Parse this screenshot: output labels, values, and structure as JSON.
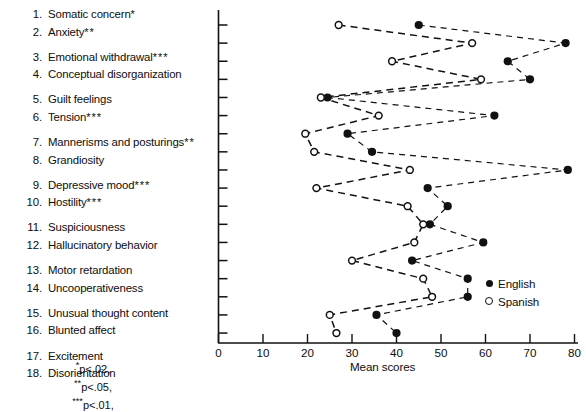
{
  "figure": {
    "items": [
      {
        "num": "1.",
        "text": "Somatic concern",
        "stars": "*"
      },
      {
        "num": "2.",
        "text": "Anxiety",
        "stars": "**"
      },
      {
        "num": "3.",
        "text": "Emotional withdrawal",
        "stars": "***"
      },
      {
        "num": "4.",
        "text": "Conceptual disorganization",
        "stars": ""
      },
      {
        "num": "5.",
        "text": "Guilt feelings",
        "stars": ""
      },
      {
        "num": "6.",
        "text": "Tension",
        "stars": "***"
      },
      {
        "num": "7.",
        "text": "Mannerisms and posturings",
        "stars": "**"
      },
      {
        "num": "8.",
        "text": "Grandiosity",
        "stars": ""
      },
      {
        "num": "9.",
        "text": "Depressive mood",
        "stars": "***"
      },
      {
        "num": "10.",
        "text": "Hostility",
        "stars": "***"
      },
      {
        "num": "11.",
        "text": "Suspiciousness",
        "stars": ""
      },
      {
        "num": "12.",
        "text": "Hallucinatory behavior",
        "stars": ""
      },
      {
        "num": "13.",
        "text": "Motor retardation",
        "stars": ""
      },
      {
        "num": "14.",
        "text": "Uncooperativeness",
        "stars": ""
      },
      {
        "num": "15.",
        "text": "Unusual thought content",
        "stars": ""
      },
      {
        "num": "16.",
        "text": "Blunted affect",
        "stars": ""
      },
      {
        "num": "17.",
        "text": "Excitement",
        "stars": ""
      },
      {
        "num": "18.",
        "text": "Disorientation",
        "stars": ""
      }
    ],
    "footnotes": [
      {
        "stars": "*",
        "body": "p<.02,"
      },
      {
        "stars": "**",
        "body": "p<.05,"
      },
      {
        "stars": "***",
        "body": "p<.01,"
      }
    ],
    "legend": [
      {
        "marker": "filled-circle",
        "label": "English"
      },
      {
        "marker": "open-circle",
        "label": "Spanish"
      }
    ],
    "colors": {
      "ink": "#111111",
      "background": "#ffffff"
    }
  },
  "chart_data": {
    "type": "line",
    "title": "",
    "xlabel": "Mean scores",
    "ylabel": "",
    "xlim": [
      0,
      80
    ],
    "xticks": [
      0,
      10,
      20,
      30,
      40,
      50,
      60,
      70,
      80
    ],
    "xtick_labels": [
      "0",
      "10",
      "20",
      "30",
      "40",
      "50",
      "60",
      "70",
      "80"
    ],
    "grid": false,
    "legend_position": "right-bottom",
    "orientation": "horizontal",
    "categories": [
      "Somatic concern",
      "Anxiety",
      "Emotional withdrawal",
      "Conceptual disorganization",
      "Guilt feelings",
      "Tension",
      "Mannerisms and posturings",
      "Grandiosity",
      "Depressive mood",
      "Hostility",
      "Suspiciousness",
      "Hallucinatory behavior",
      "Motor retardation",
      "Uncooperativeness",
      "Unusual thought content",
      "Blunted affect",
      "Excitement",
      "Disorientation"
    ],
    "series": [
      {
        "name": "English",
        "marker": "filled-circle",
        "values": [
          45,
          78,
          65,
          70,
          24.5,
          62,
          29,
          34.5,
          78.5,
          47,
          51.5,
          47.5,
          59.5,
          43.5,
          56,
          56,
          35.5,
          40
        ]
      },
      {
        "name": "Spanish",
        "marker": "open-circle",
        "values": [
          27,
          57,
          39,
          59,
          23,
          36,
          19.5,
          21.5,
          43,
          22,
          42.5,
          46,
          44,
          30,
          46,
          48,
          25,
          26.5
        ]
      }
    ]
  }
}
